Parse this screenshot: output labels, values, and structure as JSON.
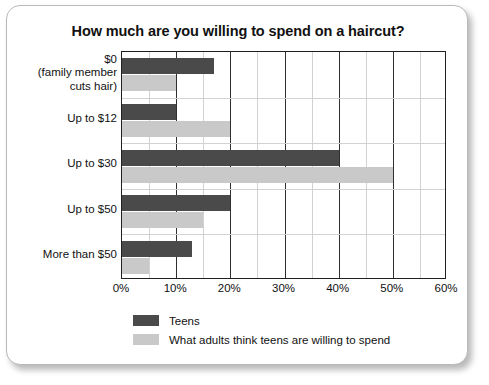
{
  "chart_data": {
    "type": "bar",
    "orientation": "horizontal",
    "title": "How much are you willing to spend on a haircut?",
    "xlabel": "",
    "ylabel": "",
    "xlim": [
      0,
      60
    ],
    "xticks": [
      "0%",
      "10%",
      "20%",
      "30%",
      "40%",
      "50%",
      "60%"
    ],
    "xtick_values": [
      0,
      10,
      20,
      30,
      40,
      50,
      60
    ],
    "minor_tick_step": 5,
    "grid": true,
    "legend_position": "below-left",
    "categories": [
      "$0\n(family member\ncuts hair)",
      "Up to $12",
      "Up to $30",
      "Up to $50",
      "More than $50"
    ],
    "category_lines": [
      [
        "$0",
        "(family member",
        "cuts hair)"
      ],
      [
        "Up to $12"
      ],
      [
        "Up to $30"
      ],
      [
        "Up to $50"
      ],
      [
        "More than $50"
      ]
    ],
    "series": [
      {
        "name": "Teens",
        "color": "#4a4a4a",
        "values": [
          17,
          10,
          40,
          20,
          13
        ]
      },
      {
        "name": "What adults think teens are willing to spend",
        "color": "#c9c9c9",
        "values": [
          10,
          20,
          50,
          15,
          5
        ]
      }
    ]
  },
  "legend": {
    "items": [
      {
        "label": "Teens",
        "color": "#4a4a4a"
      },
      {
        "label": "What adults think teens are willing to spend",
        "color": "#c9c9c9"
      }
    ]
  },
  "colors": {
    "teens": "#4a4a4a",
    "adults": "#c9c9c9",
    "axis": "#202020",
    "gridline_major": "#303030",
    "gridline_minor": "#d2d2d2",
    "text": "#111111",
    "background": "#ffffff"
  }
}
